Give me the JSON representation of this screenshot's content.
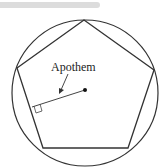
{
  "diagram": {
    "labels": {
      "apothem": "Apothem"
    },
    "shapes": [
      "circle",
      "regular-pentagon",
      "apothem-segment",
      "center-point",
      "right-angle-marker",
      "label-arrow"
    ],
    "colors": {
      "stroke": "#333333",
      "topbar": "#dcdcdc",
      "background": "#ffffff"
    }
  }
}
